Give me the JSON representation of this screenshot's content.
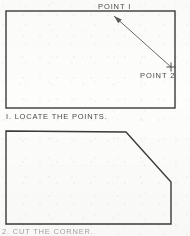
{
  "sheet": {
    "width": 190,
    "height": 236,
    "background_color": "#fdfdfc",
    "ink_color": "#3a3a3a",
    "text_color": "#4a4a4a"
  },
  "figure_1": {
    "name": "rectangle-with-diagonal-leader",
    "shape_label": "rectangle",
    "rect": {
      "x": 6,
      "y": 11,
      "width": 169,
      "height": 97
    },
    "leader_line": {
      "from_x": 114,
      "from_y": 16,
      "to_x": 171,
      "to_y": 67,
      "arrowhead_at": "start"
    },
    "point_marker": {
      "label": "cross-mark",
      "x": 171,
      "y": 67,
      "size": 9
    },
    "labels": {
      "point_1": "POINT I",
      "point_2": "POINT 2"
    }
  },
  "caption_1": {
    "text": "I. LOCATE THE POINTS."
  },
  "figure_2": {
    "name": "rectangle-with-chamfered-corner",
    "shape_label": "chamfered rectangle",
    "vertices": [
      {
        "x": 6,
        "y": 131
      },
      {
        "x": 126,
        "y": 132
      },
      {
        "x": 171,
        "y": 182
      },
      {
        "x": 171,
        "y": 224
      },
      {
        "x": 6,
        "y": 224
      }
    ]
  },
  "caption_2": {
    "text": "2. CUT THE CORNER.",
    "clipped": "true"
  }
}
